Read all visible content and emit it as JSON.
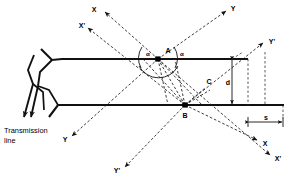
{
  "figure": {
    "background_color": "#ffffff",
    "line_color": "#111111"
  },
  "caption": {
    "transmission_line_line1": "Transmission",
    "transmission_line_line2": "line"
  },
  "points": {
    "A": {
      "label": "A",
      "x": 158,
      "y": 59
    },
    "B": {
      "label": "B",
      "x": 185,
      "y": 105
    },
    "C": {
      "label": "C",
      "x": 207,
      "y": 85
    }
  },
  "angles": {
    "alpha_left": "α",
    "alpha_right": "α"
  },
  "dimensions": {
    "vertical_label": "d",
    "horizontal_label": "s"
  },
  "axis_labels": {
    "x_top_left": "X",
    "xprime_top_left": "X'",
    "y_top_right": "Y",
    "yprime_right": "Y'",
    "y_bottom_left": "Y",
    "yprime_bottom": "Y'",
    "x_bottom_right": "X",
    "xprime_bottom_right": "X'"
  },
  "geometry": {
    "top_surface_y": 59,
    "bottom_surface_y": 105,
    "top_surface_x_start": 62,
    "top_surface_x_end": 248,
    "bottom_surface_x_start": 50,
    "bottom_surface_x_end": 284,
    "dim_vertical_x": 232,
    "dim_s_left_x": 248,
    "dim_s_right_x": 284
  }
}
